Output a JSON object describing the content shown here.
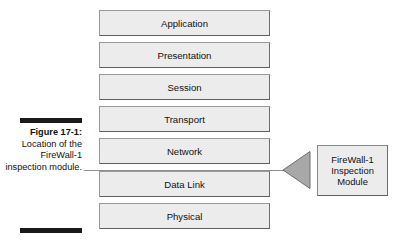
{
  "figure": {
    "caption_title": "Figure 17-1:",
    "caption_body": "Location of the FireWall-1 inspection module.",
    "rule_color": "#1a1a1a",
    "leader_line_color": "#8e8e8e"
  },
  "stack": {
    "title": "OSI model layers",
    "box_fill": "#ececec",
    "box_border": "#8a8a8a",
    "layers": [
      {
        "label": "Application",
        "top": 0
      },
      {
        "label": "Presentation",
        "top": 32
      },
      {
        "label": "Session",
        "top": 64
      },
      {
        "label": "Transport",
        "top": 96
      },
      {
        "label": "Network",
        "top": 128
      },
      {
        "label": "Data Link",
        "top": 161
      },
      {
        "label": "Physical",
        "top": 193
      }
    ]
  },
  "module": {
    "label": "FireWall-1\nInspection\nModule",
    "arrow_fill": "#a8a8a8",
    "arrow_stroke": "#6e6e6e",
    "box_fill": "#ececec",
    "box_border": "#8a8a8a"
  }
}
